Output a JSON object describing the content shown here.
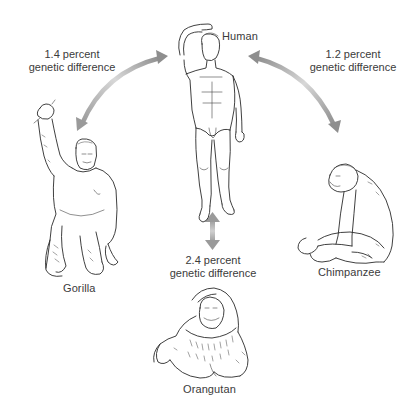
{
  "diagram": {
    "title": "",
    "background": "#ffffff",
    "arrow_color_dark": "#8a8a8a",
    "arrow_color_light": "#d4d4d4",
    "text_color": "#3b3b3b",
    "nodes": [
      {
        "id": "human",
        "label": "Human"
      },
      {
        "id": "gorilla",
        "label": "Gorilla"
      },
      {
        "id": "chimpanzee",
        "label": "Chimpanzee"
      },
      {
        "id": "orangutan",
        "label": "Orangutan"
      }
    ],
    "edges": [
      {
        "from": "human",
        "to": "gorilla",
        "value": "1.4 percent",
        "caption": "genetic difference"
      },
      {
        "from": "human",
        "to": "chimpanzee",
        "value": "1.2 percent",
        "caption": "genetic difference"
      },
      {
        "from": "human",
        "to": "orangutan",
        "value": "2.4 percent",
        "caption": "genetic difference"
      }
    ]
  },
  "labels": {
    "human": "Human",
    "gorilla": "Gorilla",
    "chimpanzee": "Chimpanzee",
    "orangutan": "Orangutan"
  },
  "differences": {
    "gorilla": {
      "value": "1.4 percent",
      "caption": "genetic difference"
    },
    "chimpanzee": {
      "value": "1.2 percent",
      "caption": "genetic difference"
    },
    "orangutan": {
      "value": "2.4 percent",
      "caption": "genetic difference"
    }
  }
}
